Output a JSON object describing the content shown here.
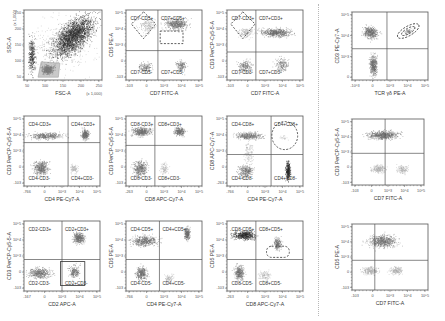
{
  "figure": {
    "colors": {
      "dots_dark": "#2a2a2a",
      "dots_mid": "#6e6e6e",
      "dots_light": "#a8a8a8",
      "axis": "#555555",
      "gate": "#333333",
      "divider": "#b8b8b8"
    }
  },
  "chart_data": [
    {
      "id": "p1",
      "type": "scatter",
      "title": "",
      "xlabel": "FSC-A",
      "ylabel": "SSC-A",
      "x_unit_note": "(x 1,000)",
      "y_unit_note": "(x 1,000)",
      "xticks": [
        "50",
        "100",
        "150",
        "200",
        "250"
      ],
      "yticks": [
        "50",
        "100",
        "150",
        "200",
        "250"
      ],
      "quadrant_labels": [],
      "gates": [
        {
          "shape": "polygon",
          "label": "lymphocytes",
          "note": "shaded region bottom-left"
        }
      ],
      "populations": [
        {
          "name": "main diagonal cloud",
          "x": [
            0.35,
            0.95
          ],
          "y": [
            0.25,
            1.0
          ],
          "density": "very high"
        },
        {
          "name": "lymphocyte gate",
          "x": [
            0.2,
            0.45
          ],
          "y": [
            0.05,
            0.25
          ],
          "density": "high"
        }
      ]
    },
    {
      "id": "p2",
      "type": "scatter",
      "xlabel": "CD7 FITC-A",
      "ylabel": "CD5 PE-A",
      "xticks": [
        "-103",
        "0",
        "10^3",
        "10^4",
        "10^5"
      ],
      "yticks": [
        "-103",
        "0",
        "10^3",
        "10^4",
        "10^5"
      ],
      "quadrant_labels": [
        "CD7-CD5+",
        "CD7+CD5+",
        "CD7-CD5-",
        "CD7+CD5-"
      ],
      "gates": [
        {
          "shape": "diamond",
          "quadrant": "UL"
        },
        {
          "shape": "dashed-rect",
          "quadrant": "UR-lower"
        }
      ],
      "populations": [
        {
          "quadrant": "UL",
          "density": "medium"
        },
        {
          "quadrant": "UR",
          "density": "very high"
        },
        {
          "quadrant": "LL",
          "density": "medium"
        },
        {
          "quadrant": "LR",
          "density": "medium"
        }
      ]
    },
    {
      "id": "p3",
      "type": "scatter",
      "xlabel": "CD7 FITC-A",
      "ylabel": "CD3 PerCP-Cy5-5-A",
      "xticks": [
        "-103",
        "0",
        "10^3",
        "10^4",
        "10^5"
      ],
      "yticks": [
        "-103",
        "0",
        "10^3",
        "10^4",
        "10^5"
      ],
      "quadrant_labels": [
        "CD7-CD3+",
        "CD7+CD3+",
        "CD7-CD3-",
        "CD7+CD3-"
      ],
      "gates": [
        {
          "shape": "diamond",
          "quadrant": "UL"
        }
      ],
      "populations": [
        {
          "quadrant": "UL-UR band",
          "density": "high"
        },
        {
          "quadrant": "LL",
          "density": "medium"
        },
        {
          "quadrant": "LR",
          "density": "medium"
        }
      ]
    },
    {
      "id": "p4",
      "type": "scatter",
      "xlabel": "TCR γδ PE-A",
      "ylabel": "CD3 PE-Cy7-A",
      "xticks": [
        "-10^3",
        "0",
        "10^3",
        "10^4",
        "10^5"
      ],
      "yticks": [
        "0",
        "10^3",
        "10^4",
        "10^5"
      ],
      "quadrant_labels": [],
      "gates": [
        {
          "shape": "dashed-ellipse",
          "quadrant": "UR"
        }
      ],
      "populations": [
        {
          "quadrant": "UL",
          "density": "high"
        },
        {
          "quadrant": "UR",
          "density": "low"
        },
        {
          "quadrant": "LL",
          "density": "high"
        }
      ]
    },
    {
      "id": "p5",
      "type": "scatter",
      "xlabel": "CD4 PE-Cy7-A",
      "ylabel": "CD3 PerCP-Cy5-5-A",
      "xticks": [
        "-766",
        "0",
        "10^3",
        "10^4",
        "10^5"
      ],
      "yticks": [
        "-103",
        "0",
        "10^3",
        "10^4",
        "10^5"
      ],
      "quadrant_labels": [
        "CD4-CD3+",
        "CD4+CD3+",
        "CD4-CD3-",
        "CD4+CD3-"
      ],
      "gates": [],
      "populations": [
        {
          "quadrant": "UL",
          "density": "medium band"
        },
        {
          "quadrant": "UR",
          "density": "high"
        },
        {
          "quadrant": "LL",
          "density": "high"
        },
        {
          "quadrant": "LR",
          "density": "low"
        }
      ]
    },
    {
      "id": "p6",
      "type": "scatter",
      "xlabel": "CD8 APC-Cy7-A",
      "ylabel": "CD3 PerCP-Cy5-5-A",
      "xticks": [
        "-263",
        "0",
        "10^3",
        "10^4",
        "10^5"
      ],
      "yticks": [
        "-103",
        "0",
        "10^3",
        "10^4",
        "10^5"
      ],
      "quadrant_labels": [
        "CD8-CD3+",
        "CD8+CD3+",
        "CD8-CD3-",
        "CD8+CD3-"
      ],
      "gates": [],
      "populations": [
        {
          "quadrant": "UL",
          "density": "high"
        },
        {
          "quadrant": "UR",
          "density": "high"
        },
        {
          "quadrant": "LL",
          "density": "high"
        },
        {
          "quadrant": "LR",
          "density": "low"
        }
      ]
    },
    {
      "id": "p7",
      "type": "scatter",
      "xlabel": "CD4 PE-Cy7-A",
      "ylabel": "CD8 APC-Cy7-A",
      "xticks": [
        "-766",
        "0",
        "10^3",
        "10^4",
        "10^5"
      ],
      "yticks": [
        "-263",
        "0",
        "10^3",
        "10^4",
        "10^5"
      ],
      "quadrant_labels": [
        "CD4-CD8+",
        "CD4+CD8+",
        "CD4-CD8-",
        "CD4+CD8-"
      ],
      "gates": [
        {
          "shape": "dashed-circle",
          "quadrant": "UR"
        }
      ],
      "populations": [
        {
          "quadrant": "UL",
          "density": "medium"
        },
        {
          "quadrant": "UR",
          "density": "very low"
        },
        {
          "quadrant": "LL",
          "density": "medium"
        },
        {
          "quadrant": "LR",
          "density": "high vertical"
        }
      ]
    },
    {
      "id": "p8",
      "type": "scatter",
      "xlabel": "CD7 FITC-A",
      "ylabel": "CD3 PerCP-Cy5-5-A",
      "xticks": [
        "-103",
        "0",
        "10^3",
        "10^4",
        "10^5"
      ],
      "yticks": [
        "-103",
        "0",
        "10^3",
        "10^4",
        "10^5"
      ],
      "quadrant_labels": [],
      "gates": [],
      "populations": [
        {
          "quadrant": "upper band",
          "density": "very high"
        },
        {
          "quadrant": "LL",
          "density": "medium"
        },
        {
          "quadrant": "LR",
          "density": "low"
        }
      ]
    },
    {
      "id": "p9",
      "type": "scatter",
      "xlabel": "CD2 APC-A",
      "ylabel": "CD3 PerCP-Cy5-5-A",
      "xticks": [
        "-167",
        "0",
        "10^3",
        "10^4",
        "10^5"
      ],
      "yticks": [
        "-103",
        "0",
        "10^3",
        "10^4",
        "10^5"
      ],
      "quadrant_labels": [
        "CD2-CD3+",
        "CD2+CD3+",
        "CD2-CD3-",
        "CD2+CD3-"
      ],
      "gates": [
        {
          "shape": "rect",
          "quadrant": "LR"
        }
      ],
      "populations": [
        {
          "quadrant": "UR",
          "density": "high"
        },
        {
          "quadrant": "LL",
          "density": "high"
        },
        {
          "quadrant": "LR",
          "density": "medium"
        }
      ]
    },
    {
      "id": "p10",
      "type": "scatter",
      "xlabel": "CD4 PE-Cy7-A",
      "ylabel": "CD5 PE-A",
      "xticks": [
        "-766",
        "0",
        "10^3",
        "10^4",
        "10^5"
      ],
      "yticks": [
        "-103",
        "0",
        "10^3",
        "10^4",
        "10^5"
      ],
      "quadrant_labels": [
        "CD4-CD5+",
        "CD4+CD5+",
        "CD4-CD5-",
        "CD4+CD5-"
      ],
      "gates": [],
      "populations": [
        {
          "quadrant": "UL",
          "density": "high"
        },
        {
          "quadrant": "UR",
          "density": "high vertical"
        },
        {
          "quadrant": "LL",
          "density": "high"
        },
        {
          "quadrant": "LR",
          "density": "low"
        }
      ]
    },
    {
      "id": "p11",
      "type": "scatter",
      "xlabel": "CD8 APC-Cy7-A",
      "ylabel": "CD5 PE-A",
      "xticks": [
        "-263",
        "0",
        "10^3",
        "10^4",
        "10^5"
      ],
      "yticks": [
        "-103",
        "0",
        "10^3",
        "10^4",
        "10^5"
      ],
      "quadrant_labels": [
        "CD8-CD5+",
        "CD8+CD5+",
        "CD8-CD5-",
        "CD8+CD5-"
      ],
      "gates": [
        {
          "shape": "dashed-rounded-rect",
          "quadrant": "UR-lower"
        }
      ],
      "populations": [
        {
          "quadrant": "UL",
          "density": "very high"
        },
        {
          "quadrant": "UR",
          "density": "medium"
        },
        {
          "quadrant": "LL",
          "density": "high"
        },
        {
          "quadrant": "LR",
          "density": "low"
        }
      ]
    },
    {
      "id": "p12",
      "type": "scatter",
      "xlabel": "CD7 FITC-A",
      "ylabel": "CD5 PE-A",
      "xticks": [
        "-103",
        "0",
        "10^3",
        "10^4",
        "10^5"
      ],
      "yticks": [
        "-103",
        "0",
        "10^3",
        "10^4",
        "10^5"
      ],
      "quadrant_labels": [],
      "gates": [],
      "populations": [
        {
          "quadrant": "upper",
          "density": "high"
        },
        {
          "quadrant": "LL",
          "density": "medium"
        },
        {
          "quadrant": "LR",
          "density": "low"
        }
      ]
    }
  ]
}
